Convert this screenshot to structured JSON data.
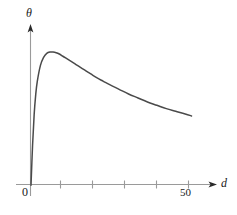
{
  "figure": {
    "background_color": "#ffffff",
    "axis_color": "#9a9a9a",
    "curve_color": "#4a4a4a",
    "text_color": "#1a1a1a"
  },
  "axes": {
    "y_axis_label": "θ",
    "x_axis_label": "d",
    "origin_label": "0",
    "x_tick_labels": [
      "50"
    ]
  },
  "chart_data": {
    "type": "line",
    "title": "",
    "xlabel": "d",
    "ylabel": "θ",
    "grid": false,
    "legend": null,
    "xlim": [
      0,
      55
    ],
    "ylim": [
      0,
      1.15
    ],
    "x_ticks": [
      10,
      20,
      30,
      40,
      50
    ],
    "x_tick_labels": [
      "",
      "",
      "",
      "",
      "50"
    ],
    "y_ticks": [],
    "y_tick_labels": [],
    "series": [
      {
        "name": "theta vs d",
        "x": [
          0,
          0.5,
          1,
          1.5,
          2,
          3,
          4,
          5,
          6,
          7,
          8,
          9,
          10,
          11,
          12,
          13,
          14,
          15,
          17,
          19,
          21,
          23,
          25,
          28,
          31,
          34,
          37,
          40,
          43,
          46,
          49,
          51
        ],
        "y": [
          0,
          0.3,
          0.53,
          0.68,
          0.78,
          0.9,
          0.96,
          0.99,
          1.0,
          1.0,
          0.995,
          0.985,
          0.97,
          0.955,
          0.94,
          0.925,
          0.91,
          0.895,
          0.865,
          0.835,
          0.805,
          0.78,
          0.755,
          0.72,
          0.685,
          0.655,
          0.625,
          0.6,
          0.575,
          0.555,
          0.535,
          0.52
        ]
      }
    ],
    "annotations": [
      {
        "text": "origin",
        "label": "0",
        "x": 0,
        "y": 0
      }
    ]
  }
}
